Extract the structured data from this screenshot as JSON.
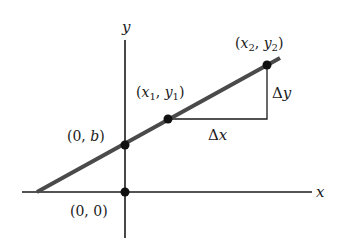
{
  "diagram": {
    "axes": {
      "x_label": "x",
      "y_label": "y"
    },
    "points": [
      {
        "id": "origin",
        "label": "(0, 0)",
        "x": 125,
        "y": 192
      },
      {
        "id": "intercept",
        "label": "(0, b)",
        "x": 125,
        "y": 145
      },
      {
        "id": "p1",
        "label": "(x1, y1)",
        "x": 168,
        "y": 119
      },
      {
        "id": "p2",
        "label": "(x2, y2)",
        "x": 267,
        "y": 65
      }
    ],
    "labels": {
      "origin": "(0, 0)",
      "intercept_open": "(0, ",
      "intercept_var": "b",
      "intercept_close": ")",
      "p1_open": "(",
      "p1_x": "x",
      "p1_x_sub": "1",
      "p1_sep": ", ",
      "p1_y": "y",
      "p1_y_sub": "1",
      "p1_close": ")",
      "p2_open": "(",
      "p2_x": "x",
      "p2_x_sub": "2",
      "p2_sep": ", ",
      "p2_y": "y",
      "p2_y_sub": "2",
      "p2_close": ")",
      "delta": "Δ",
      "delta_x_var": "x",
      "delta_y_var": "y"
    },
    "colors": {
      "line": "#4a4a4a",
      "axes": "#1a1a1a",
      "points": "#111111"
    }
  }
}
